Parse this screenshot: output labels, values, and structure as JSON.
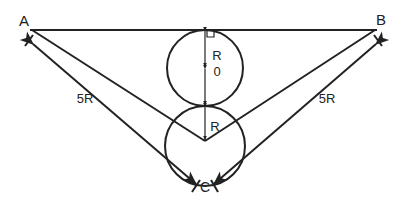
{
  "diagram": {
    "labels": {
      "point_a": "A",
      "point_b": "B",
      "point_c": "C",
      "left_length": "5R",
      "right_length": "5R",
      "upper_radius_r": "R",
      "upper_radius_sub": "0",
      "lower_radius": "R"
    },
    "colors": {
      "stroke": "#222222",
      "background": "#ffffff"
    }
  }
}
